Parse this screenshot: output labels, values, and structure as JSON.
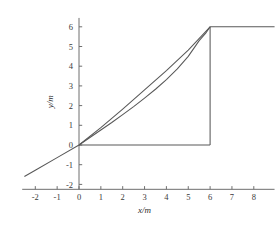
{
  "chart_data": {
    "type": "line",
    "title": "",
    "xlabel": "x/m",
    "ylabel": "y/m",
    "xlim": [
      -2.6,
      8.95
    ],
    "ylim": [
      -2.25,
      6.45
    ],
    "grid": false,
    "legend": null,
    "xticks": [
      -2,
      -1,
      0,
      1,
      2,
      3,
      4,
      5,
      6,
      7,
      8
    ],
    "xticklabels": [
      "-2",
      "-1",
      "0",
      "1",
      "2",
      "3",
      "4",
      "5",
      "6",
      "7",
      "8"
    ],
    "yticks": [
      -2,
      -1,
      0,
      1,
      2,
      3,
      4,
      5,
      6
    ],
    "yticklabels": [
      "-2",
      "-1",
      "0",
      "1",
      "2",
      "3",
      "4",
      "5",
      "6"
    ],
    "line_color": "#585858",
    "axis_color": "#6f6f6f",
    "background": "#ffffff",
    "series": [
      {
        "name": "straight-chord",
        "comment": "straight line through origin extending left to -2.5 and up to (6,6)",
        "x": [
          -2.5,
          -2.0,
          -1.0,
          0.0,
          1.0,
          2.0,
          3.0,
          4.0,
          5.0,
          6.0
        ],
        "y": [
          -1.6,
          -1.28,
          -0.64,
          0.0,
          0.88,
          1.82,
          2.8,
          3.78,
          4.82,
          6.0
        ]
      },
      {
        "name": "concave-up-curve",
        "comment": "lower curve from origin rising steeply to (6,6)",
        "x": [
          0.0,
          0.5,
          1.0,
          1.5,
          2.0,
          2.5,
          3.0,
          3.5,
          4.0,
          4.5,
          5.0,
          5.5,
          5.8,
          6.0
        ],
        "y": [
          0.0,
          0.38,
          0.76,
          1.14,
          1.54,
          1.95,
          2.38,
          2.83,
          3.32,
          3.86,
          4.5,
          5.3,
          5.68,
          6.0
        ]
      },
      {
        "name": "top-plateau",
        "comment": "horizontal segment at y=6 from x=6 to right edge",
        "x": [
          6.0,
          8.95
        ],
        "y": [
          6.0,
          6.0
        ]
      },
      {
        "name": "vertical-drop",
        "comment": "vertical segment at x=6 from y=6 down to y=0",
        "x": [
          6.0,
          6.0
        ],
        "y": [
          6.0,
          0.0
        ]
      },
      {
        "name": "baseline",
        "comment": "horizontal segment at y=0 from x=0 to x=6",
        "x": [
          0.0,
          6.0
        ],
        "y": [
          0.0,
          0.0
        ]
      }
    ]
  }
}
